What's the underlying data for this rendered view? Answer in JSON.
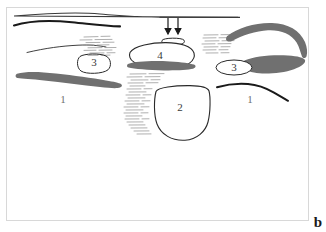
{
  "figure": {
    "panel_letter": "b",
    "background_color": "#ffffff",
    "frame_color": "#d8d8d8",
    "width": 326,
    "height": 232
  },
  "palette": {
    "outline_black": "#1a1a1a",
    "outline_gray": "#5a5a5a",
    "blob_gray": "#707070",
    "hatch_gray": "#9a9a9a",
    "label_gray": "#707070",
    "label_dark": "#3a3a3a"
  },
  "labels": {
    "left_structure": "1",
    "right_structure": "1",
    "center_structure": "2",
    "left_nodule": "3",
    "right_nodule": "3",
    "top_center_structure": "4"
  },
  "annotations": {
    "arrow_count": 2,
    "arrow_direction": "down",
    "arrow_color": "#1a1a1a"
  },
  "elements": [
    {
      "name": "skin-line-top",
      "type": "thin-curve",
      "color": "#3a3a3a"
    },
    {
      "name": "fascia-line-left",
      "type": "thick-curve",
      "color": "#1a1a1a"
    },
    {
      "name": "muscle-line-left",
      "type": "thin-curve",
      "color": "#1a1a1a"
    },
    {
      "name": "shadow-hatch-left",
      "type": "hatching",
      "color": "#9a9a9a"
    },
    {
      "name": "nodule-left",
      "type": "rounded-outline",
      "label": "3"
    },
    {
      "name": "blob-left",
      "type": "filled-blob",
      "color": "#707070",
      "label": "1"
    },
    {
      "name": "small-oval-top-center",
      "type": "outline-oval"
    },
    {
      "name": "oval-center",
      "type": "outline-oval",
      "label": "4"
    },
    {
      "name": "band-under-oval",
      "type": "filled-band",
      "color": "#707070"
    },
    {
      "name": "shadow-hatch-center",
      "type": "hatching",
      "color": "#9a9a9a"
    },
    {
      "name": "bladder-center",
      "type": "rounded-outline",
      "label": "2"
    },
    {
      "name": "shadow-hatch-right",
      "type": "hatching",
      "color": "#9a9a9a"
    },
    {
      "name": "arc-blob-right",
      "type": "filled-blob",
      "color": "#707070"
    },
    {
      "name": "lens-blob-right",
      "type": "filled-blob",
      "color": "#707070"
    },
    {
      "name": "nodule-right",
      "type": "outline-ellipse",
      "label": "3"
    },
    {
      "name": "fascia-line-right",
      "type": "thick-curve",
      "color": "#1a1a1a",
      "label": "1"
    }
  ]
}
